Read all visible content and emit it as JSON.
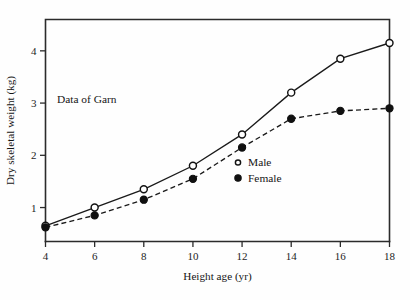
{
  "chart_data": {
    "type": "line",
    "title": "",
    "annotation": "Data of Garn",
    "xlabel": "Height age (yr)",
    "ylabel": "Dry skeletal weight (kg)",
    "xlim": [
      4,
      18
    ],
    "ylim": [
      0.35,
      4.6
    ],
    "xticks": [
      4,
      6,
      8,
      10,
      12,
      14,
      16,
      18
    ],
    "yticks": [
      1,
      2,
      3,
      4
    ],
    "grid": false,
    "legend_position": "center-right",
    "x": [
      4,
      6,
      8,
      10,
      12,
      14,
      16,
      18
    ],
    "series": [
      {
        "name": "Male",
        "marker": "open-circle",
        "linestyle": "solid",
        "values": [
          0.65,
          1.0,
          1.35,
          1.8,
          2.4,
          3.2,
          3.85,
          4.15
        ]
      },
      {
        "name": "Female",
        "marker": "filled-circle",
        "linestyle": "dashed",
        "values": [
          0.62,
          0.85,
          1.15,
          1.55,
          2.15,
          2.7,
          2.85,
          2.9
        ]
      }
    ],
    "legend": [
      {
        "label": "Male",
        "marker": "open-circle"
      },
      {
        "label": "Female",
        "marker": "filled-circle"
      }
    ],
    "colors": {
      "ink": "#1a1a1a",
      "background": "#fefefe"
    }
  }
}
